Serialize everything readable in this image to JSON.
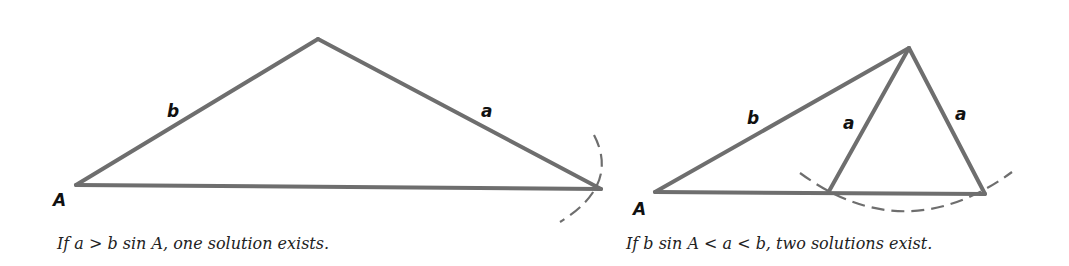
{
  "figures": [
    {
      "id": "one-solution",
      "caption": "If a > b  sin A, one solution exists.",
      "labels": {
        "A": "A",
        "b": "b",
        "a": "a"
      },
      "vertices": {
        "A": [
          76,
          185
        ],
        "apex": [
          318,
          39
        ],
        "C": [
          601,
          189
        ]
      }
    },
    {
      "id": "two-solutions",
      "caption": "If b sin A < a < b, two solutions exist.",
      "labels": {
        "A": "A",
        "b": "b",
        "a_inner": "a",
        "a_outer": "a"
      },
      "vertices": {
        "A": [
          655,
          192
        ],
        "apex": [
          909,
          48
        ],
        "C1": [
          828,
          193
        ],
        "C2": [
          985,
          194
        ]
      }
    }
  ],
  "colors": {
    "stroke": "#6e6e6e",
    "text": "#111111",
    "background": "#ffffff"
  }
}
